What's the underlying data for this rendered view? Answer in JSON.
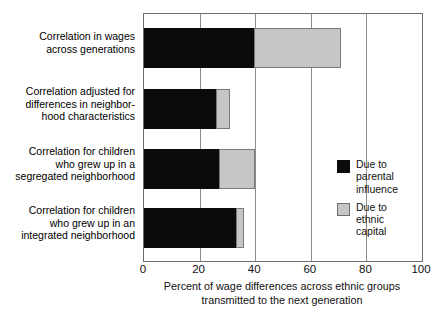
{
  "chart_data": {
    "type": "bar",
    "orientation": "horizontal",
    "stacked": true,
    "title": "",
    "xlabel": "Percent of wage differences across ethnic groups\ntransmitted to the next generation",
    "ylabel": "",
    "xlim": [
      0,
      100
    ],
    "xticks": [
      0,
      20,
      40,
      60,
      80,
      100
    ],
    "xtick_labels": [
      "0",
      "20",
      "40",
      "60",
      "80",
      "100"
    ],
    "grid": "vertical",
    "legend_position": "right-middle",
    "categories": [
      "Correlation in wages\nacross generations",
      "Correlation adjusted for\ndifferences in neighbor-\nhood characteristics",
      "Correlation for children\nwho grew up in a\nsegregated neighborhood",
      "Correlation for children\nwho grew up in an\nintegrated neighborhood"
    ],
    "series": [
      {
        "name": "Due to\nparental\ninfluence",
        "key": "parental",
        "color": "#0b0b0b",
        "values": [
          39.5,
          26,
          27,
          33
        ]
      },
      {
        "name": "Due to\nethnic\ncapital",
        "key": "ethnic",
        "color": "#c6c6c6",
        "values": [
          31.5,
          5,
          13,
          3
        ]
      }
    ],
    "totals": [
      71,
      31,
      40,
      36
    ]
  },
  "legend": {
    "entries": [
      {
        "label": "Due to\nparental\ninfluence",
        "swatch": "black-swatch-icon"
      },
      {
        "label": "Due to\nethnic\ncapital",
        "swatch": "gray-swatch-icon"
      }
    ]
  },
  "axis": {
    "x_title": "Percent of wage differences across ethnic groups\ntransmitted to the next generation",
    "x_tick_labels": [
      "0",
      "20",
      "40",
      "60",
      "80",
      "100"
    ]
  },
  "colors": {
    "parental": "#0b0b0b",
    "ethnic": "#c6c6c6",
    "frame": "#6e6e6e",
    "grid": "#8d8d8d",
    "background": "#ffffff",
    "text": "#111111"
  }
}
